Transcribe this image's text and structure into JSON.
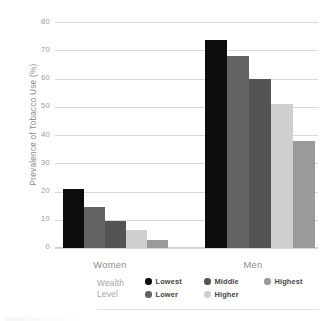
{
  "chart_data": {
    "type": "bar",
    "title": "",
    "xlabel": "",
    "ylabel": "Prevalence of Tobacco Use (%)",
    "ylim": [
      0,
      80
    ],
    "yticks": [
      0,
      10,
      20,
      30,
      40,
      50,
      60,
      70,
      80
    ],
    "grid": true,
    "legend_position": "bottom",
    "legend_title_line1": "Wealth",
    "legend_title_line2": "Level",
    "categories": [
      "Women",
      "Men"
    ],
    "series": [
      {
        "name": "Lowest",
        "color": "#0d0d0d",
        "values": [
          21.0,
          73.5
        ]
      },
      {
        "name": "Lower",
        "color": "#636363",
        "values": [
          14.5,
          68.0
        ]
      },
      {
        "name": "Middle",
        "color": "#545454",
        "values": [
          9.5,
          60.0
        ]
      },
      {
        "name": "Higher",
        "color": "#cfcfcf",
        "values": [
          6.5,
          51.0
        ]
      },
      {
        "name": "Highest",
        "color": "#9a9a9a",
        "values": [
          3.0,
          38.0
        ]
      }
    ]
  },
  "axis": {
    "y_title": "Prevalence of Tobacco Use (%)",
    "tick_80": "80",
    "tick_70": "70",
    "tick_60": "60",
    "tick_50": "50",
    "tick_40": "40",
    "tick_30": "30",
    "tick_20": "20",
    "tick_10": "10",
    "tick_0": "0"
  },
  "groups": {
    "women_label": "Women",
    "men_label": "Men"
  },
  "legend": {
    "title_line1": "Wealth",
    "title_line2": "Level",
    "items": [
      {
        "label": "Lowest",
        "color": "#0d0d0d"
      },
      {
        "label": "Lower",
        "color": "#636363"
      },
      {
        "label": "Middle",
        "color": "#545454"
      },
      {
        "label": "Higher",
        "color": "#cfcfcf"
      },
      {
        "label": "Highest",
        "color": "#9a9a9a"
      }
    ]
  }
}
